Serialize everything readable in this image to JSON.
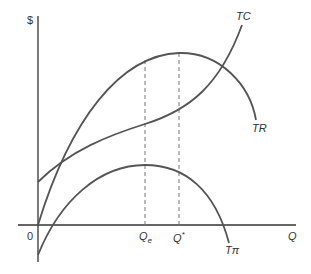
{
  "diagram": {
    "y_axis_label": "$",
    "x_axis_label": "Q",
    "origin_label": "0",
    "curves": [
      {
        "name": "TC",
        "label": "TC",
        "description": "Total cost, cubic shape starting at positive intercept"
      },
      {
        "name": "TR",
        "label": "TR",
        "description": "Total revenue, concave starting at origin, peaks at Q*"
      },
      {
        "name": "Tpi",
        "label": "Tπ",
        "description": "Total profit, starts negative, peaks at Qe"
      }
    ],
    "x_markers": [
      {
        "label_main": "Q",
        "label_sub": "e",
        "meaning": "Profit-maximizing output"
      },
      {
        "label_main": "Q",
        "label_sup": "*",
        "meaning": "Revenue-maximizing output"
      }
    ],
    "colors": {
      "curve": "#555555",
      "axis": "#333333",
      "dashed": "#777777"
    }
  }
}
